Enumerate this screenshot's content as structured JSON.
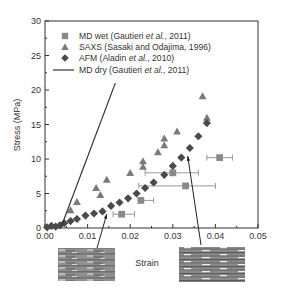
{
  "chart_data": {
    "type": "scatter",
    "title": "",
    "xlabel": "Strain",
    "ylabel": "Stress (MPa)",
    "xlim": [
      0,
      0.05
    ],
    "ylim": [
      0,
      30
    ],
    "xticks": [
      "0.00",
      "0.01",
      "0.02",
      "0.03",
      "0.04",
      "0.05"
    ],
    "yticks": [
      "0",
      "5",
      "10",
      "15",
      "20",
      "25",
      "30"
    ],
    "grid": false,
    "legend_position": "upper left",
    "series": [
      {
        "name": "MD wet (Gautieri et al., 2011)",
        "label_parts": [
          "MD wet (Gautieri ",
          "et al.",
          ", 2011)"
        ],
        "marker": "square",
        "color": "#8a8a8a",
        "points": [
          {
            "x": 0.018,
            "y": 2.0,
            "xerr_low": 0.016,
            "xerr_high": 0.021
          },
          {
            "x": 0.0225,
            "y": 4.0,
            "xerr_low": 0.0225,
            "xerr_high": 0.0255
          },
          {
            "x": 0.033,
            "y": 6.1,
            "xerr_low": 0.022,
            "xerr_high": 0.04
          },
          {
            "x": 0.03,
            "y": 8.0,
            "xerr_low": 0.0235,
            "xerr_high": 0.036
          },
          {
            "x": 0.041,
            "y": 10.2,
            "xerr_low": 0.038,
            "xerr_high": 0.044
          }
        ]
      },
      {
        "name": "SAXS (Sasaki and Odajima, 1996)",
        "label_parts": [
          "SAXS (Sasaki and Odajima, 1996)",
          "",
          ""
        ],
        "marker": "triangle",
        "color": "#7a7a7a",
        "points": [
          {
            "x": 0.006,
            "y": 2.6
          },
          {
            "x": 0.0075,
            "y": 3.8
          },
          {
            "x": 0.012,
            "y": 5.8
          },
          {
            "x": 0.013,
            "y": 4.8
          },
          {
            "x": 0.0145,
            "y": 7.0
          },
          {
            "x": 0.02,
            "y": 8.0
          },
          {
            "x": 0.023,
            "y": 8.9
          },
          {
            "x": 0.023,
            "y": 9.7
          },
          {
            "x": 0.0265,
            "y": 11.0
          },
          {
            "x": 0.028,
            "y": 12.0
          },
          {
            "x": 0.028,
            "y": 13.0
          },
          {
            "x": 0.031,
            "y": 14.0
          },
          {
            "x": 0.037,
            "y": 19.1
          },
          {
            "x": 0.038,
            "y": 16.0
          }
        ]
      },
      {
        "name": "AFM (Aladin et al., 2010)",
        "label_parts": [
          "AFM (Aladin ",
          "et al.",
          ", 2010)"
        ],
        "marker": "diamond",
        "color": "#4a4a4a",
        "points": [
          {
            "x": 0.0005,
            "y": 0.1
          },
          {
            "x": 0.0015,
            "y": 0.3
          },
          {
            "x": 0.0025,
            "y": 0.2
          },
          {
            "x": 0.0035,
            "y": 0.4
          },
          {
            "x": 0.0045,
            "y": 0.7
          },
          {
            "x": 0.006,
            "y": 1.0
          },
          {
            "x": 0.0075,
            "y": 1.3
          },
          {
            "x": 0.0095,
            "y": 1.8
          },
          {
            "x": 0.0115,
            "y": 2.1
          },
          {
            "x": 0.0135,
            "y": 2.4
          },
          {
            "x": 0.0155,
            "y": 3.2
          },
          {
            "x": 0.0175,
            "y": 3.7
          },
          {
            "x": 0.0195,
            "y": 4.3
          },
          {
            "x": 0.0215,
            "y": 5.0
          },
          {
            "x": 0.0235,
            "y": 5.8
          },
          {
            "x": 0.0255,
            "y": 6.6
          },
          {
            "x": 0.028,
            "y": 7.7
          },
          {
            "x": 0.03,
            "y": 9.0
          },
          {
            "x": 0.032,
            "y": 10.2
          },
          {
            "x": 0.034,
            "y": 11.6
          },
          {
            "x": 0.036,
            "y": 13.3
          },
          {
            "x": 0.038,
            "y": 15.2
          }
        ]
      },
      {
        "name": "MD dry (Gautieri et al., 2011)",
        "label_parts": [
          "MD dry (Gautieri ",
          "et al.",
          ", 2011)"
        ],
        "marker": "line",
        "color": "#333333",
        "points": [
          {
            "x": 0.0037,
            "y": 0.0
          },
          {
            "x": 0.0165,
            "y": 21.0
          }
        ]
      }
    ],
    "annotations": [
      {
        "type": "arrow",
        "from_image": "left-structure",
        "to": {
          "x": 0.0145,
          "y": 2.6
        }
      },
      {
        "type": "arrow",
        "from_image": "right-structure",
        "to": {
          "x": 0.0335,
          "y": 11.0
        }
      },
      {
        "type": "image",
        "name": "left-structure",
        "description": "molecular structure (compact)"
      },
      {
        "type": "image",
        "name": "right-structure",
        "description": "molecular structure (stretched)"
      }
    ]
  }
}
